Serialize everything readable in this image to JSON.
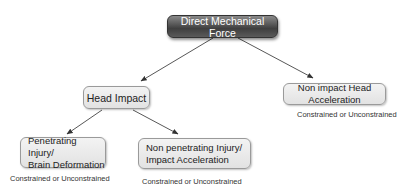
{
  "diagram": {
    "root": {
      "label": "Direct Mechanical Force"
    },
    "nodes": [
      {
        "id": "head-impact",
        "label": "Head Impact"
      },
      {
        "id": "non-impact",
        "label": "Non impact Head Acceleration",
        "caption": "Constrained or Unconstrained"
      },
      {
        "id": "penetrating",
        "line1": "Penetrating Injury/",
        "line2": "Brain Deformation",
        "caption": "Constrained or Unconstrained"
      },
      {
        "id": "non-penetrating",
        "line1": "Non penetrating Injury/",
        "line2": "Impact Acceleration",
        "caption": "Constrained or Unconstrained"
      }
    ],
    "edges": [
      {
        "from": "Direct Mechanical Force",
        "to": "Head Impact"
      },
      {
        "from": "Direct Mechanical Force",
        "to": "Non impact Head Acceleration"
      },
      {
        "from": "Head Impact",
        "to": "Penetrating Injury/Brain Deformation"
      },
      {
        "from": "Head Impact",
        "to": "Non penetrating Injury/Impact Acceleration"
      }
    ],
    "colors": {
      "root_fill": "#4a4a4a",
      "node_fill": "#e9e9e9",
      "node_border": "#9a9a9a",
      "edge": "#333333"
    }
  }
}
